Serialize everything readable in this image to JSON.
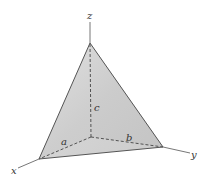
{
  "figure": {
    "type": "tetrahedron-in-first-octant",
    "labels": {
      "x_axis": "x",
      "y_axis": "y",
      "z_axis": "z",
      "a": "a",
      "b": "b",
      "c": "c"
    },
    "colors": {
      "face": "#cfcfcf",
      "face_dark": "#bdbdbd",
      "edge": "#555555",
      "axis": "#777777",
      "dashed": "#444444"
    },
    "points": {
      "origin": [
        91,
        137
      ],
      "x_intercept": [
        39,
        159
      ],
      "y_intercept": [
        163,
        147
      ],
      "z_intercept": [
        90,
        43
      ],
      "x_axis_end": [
        18,
        168
      ],
      "y_axis_end": [
        190,
        153
      ],
      "z_axis_end": [
        90,
        22
      ]
    }
  }
}
